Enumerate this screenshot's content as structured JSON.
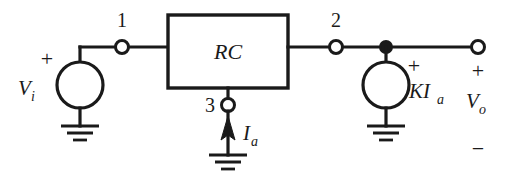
{
  "figure": {
    "name": "two-port-rc-network-with-dependent-source",
    "background_color": "#ffffff",
    "line_color": "#1a1a1a"
  },
  "block": {
    "label": "RC"
  },
  "nodes": {
    "n1": "1",
    "n2": "2",
    "n3": "3"
  },
  "sources": {
    "input": {
      "label": "V",
      "subscript": "i",
      "polarity_plus": "+"
    },
    "dependent": {
      "label": "KI",
      "subscript": "a",
      "polarity_plus": "+"
    }
  },
  "current": {
    "label": "I",
    "subscript": "a"
  },
  "output": {
    "label": "V",
    "subscript": "o",
    "polarity_plus": "+",
    "polarity_minus": "−"
  }
}
